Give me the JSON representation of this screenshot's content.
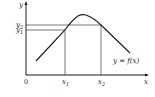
{
  "diagram": {
    "axes": {
      "x_label": "x",
      "y_label": "y",
      "origin_label": "0"
    },
    "curve_label": "y = f(x)",
    "points": {
      "x1_label": "x",
      "x1_sub": "1",
      "x2_label": "x",
      "x2_sub": "2",
      "y1_label": "y",
      "y1_sub": "1",
      "y2_label": "y",
      "y2_sub": "2"
    },
    "colors": {
      "curve": "#1a1a1a",
      "guides": "#555555",
      "axes": "#1a1a1a"
    }
  }
}
